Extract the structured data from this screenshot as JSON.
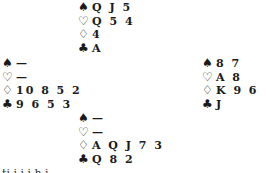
{
  "hands": {
    "north": {
      "spades": "Q J 5",
      "hearts": "Q 5 4",
      "diamonds": "4",
      "clubs": "A"
    },
    "west": {
      "spades": "—",
      "hearts": "—",
      "diamonds": "10 8 5 2",
      "clubs": "9 6 5 3"
    },
    "east": {
      "spades": "8 7",
      "hearts": "A 8",
      "diamonds": "K 9 6",
      "clubs": "J"
    },
    "south": {
      "spades": "—",
      "hearts": "—",
      "diamonds": "A Q J 7 3",
      "clubs": "Q 8 2"
    }
  },
  "suit_symbols": {
    "spades": "♠",
    "hearts": "♡",
    "diamonds": "♢",
    "clubs": "♣"
  },
  "cut_text": "ti  i  i   i   h i"
}
